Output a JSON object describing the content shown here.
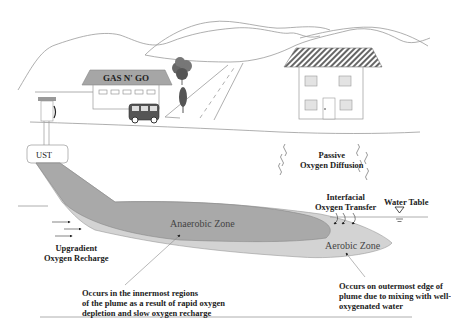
{
  "diagram": {
    "type": "Groundwater petroleum plume oxygen zones",
    "colors": {
      "anaerobic_zone": "#a9a9a9",
      "aerobic_zone": "#d3d3d3",
      "lines": "#8a8a8a",
      "text": "#222222",
      "roof_gas_station": "#a6a6a6"
    }
  },
  "scene": {
    "gas_station_sign": "GAS N' GO",
    "ust_label": "UST"
  },
  "labels": {
    "passive_diffusion_line1": "Passive",
    "passive_diffusion_line2": "Oxygen Diffusion",
    "interfacial_line1": "Interfacial",
    "interfacial_line2": "Oxygen Transfer",
    "water_table": "Water Table",
    "upgradient_line1": "Upgradient",
    "upgradient_line2": "Oxygen Recharge",
    "anaerobic_zone": "Anaerobic Zone",
    "aerobic_zone": "Aerobic Zone",
    "anaerobic_note_line1": "Occurs in the innermost regions",
    "anaerobic_note_line2": "of the plume as a result of rapid oxygen",
    "anaerobic_note_line3": "depletion and slow oxygen recharge",
    "aerobic_note_line1": "Occurs on outermost edge of",
    "aerobic_note_line2": "plume due to mixing with well-",
    "aerobic_note_line3": "oxygenated water"
  }
}
